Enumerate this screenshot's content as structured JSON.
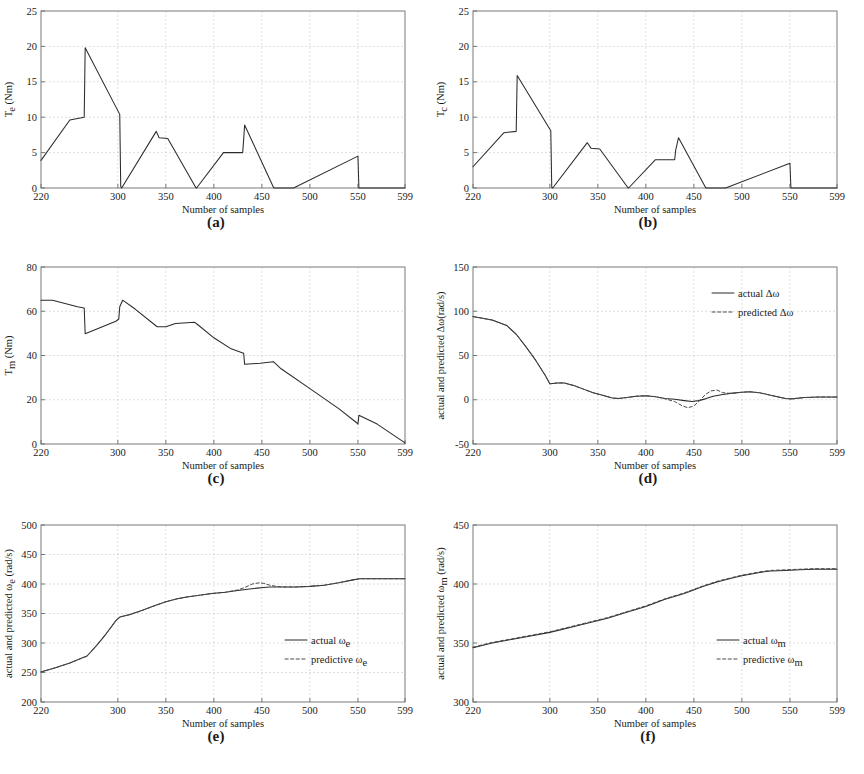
{
  "figure": {
    "panel_count": 6,
    "shared_xlabel": "Number of samples",
    "x_ticks": [
      220,
      300,
      350,
      400,
      450,
      500,
      550,
      599
    ],
    "xlim": [
      220,
      599
    ],
    "grid": true
  },
  "panels": [
    {
      "caption": "(a)",
      "chart_data": {
        "type": "line",
        "title": "",
        "xlabel": "Number of samples",
        "ylabel": "T_e (Nm)",
        "ylabel_main": "T",
        "ylabel_sub": "e",
        "ylabel_unit": " (Nm)",
        "xlim": [
          220,
          599
        ],
        "ylim": [
          0,
          25
        ],
        "x_ticks": [
          220,
          300,
          350,
          400,
          450,
          500,
          550,
          599
        ],
        "y_ticks": [
          0,
          5,
          10,
          15,
          20,
          25
        ],
        "grid": true,
        "legend": null,
        "series": [
          {
            "name": "T_e",
            "style": "solid",
            "x": [
              220,
              250,
              265,
              266,
              302,
              303,
              304,
              340,
              343,
              352,
              381,
              382,
              410,
              430,
              431,
              432,
              462,
              463,
              483,
              550,
              551,
              599
            ],
            "y": [
              3.9,
              9.6,
              10.0,
              19.8,
              10.4,
              0.2,
              0.0,
              8.0,
              7.1,
              7.0,
              0.1,
              0.0,
              5.0,
              5.0,
              6.8,
              8.9,
              0.1,
              0.0,
              0.0,
              4.5,
              0.0,
              0.0
            ]
          }
        ]
      }
    },
    {
      "caption": "(b)",
      "chart_data": {
        "type": "line",
        "title": "",
        "xlabel": "Number of samples",
        "ylabel": "T_c (Nm)",
        "ylabel_main": "T",
        "ylabel_sub": "c",
        "ylabel_unit": " (Nm)",
        "xlim": [
          220,
          599
        ],
        "ylim": [
          0,
          25
        ],
        "x_ticks": [
          220,
          300,
          350,
          400,
          450,
          500,
          550,
          599
        ],
        "y_ticks": [
          0,
          5,
          10,
          15,
          20,
          25
        ],
        "grid": true,
        "legend": null,
        "series": [
          {
            "name": "T_c",
            "style": "solid",
            "x": [
              220,
              252,
              265,
              266,
              301,
              302,
              303,
              339,
              343,
              352,
              381,
              382,
              410,
              430,
              431,
              434,
              462,
              463,
              483,
              550,
              551,
              599
            ],
            "y": [
              3.0,
              7.8,
              8.0,
              15.9,
              8.1,
              0.1,
              0.0,
              6.4,
              5.6,
              5.5,
              0.1,
              0.0,
              4.0,
              4.0,
              5.3,
              7.1,
              0.1,
              0.0,
              0.0,
              3.5,
              0.0,
              0.0
            ]
          }
        ]
      }
    },
    {
      "caption": "(c)",
      "chart_data": {
        "type": "line",
        "title": "",
        "xlabel": "Number of samples",
        "ylabel": "T_m (Nm)",
        "ylabel_main": "T",
        "ylabel_sub": "m",
        "ylabel_unit": " (Nm)",
        "xlim": [
          220,
          599
        ],
        "ylim": [
          0,
          80
        ],
        "x_ticks": [
          220,
          300,
          350,
          400,
          450,
          500,
          550,
          599
        ],
        "y_ticks": [
          0,
          20,
          40,
          60,
          80
        ],
        "grid": true,
        "legend": null,
        "series": [
          {
            "name": "T_m",
            "style": "solid",
            "x": [
              220,
              232,
              258,
              265,
              266,
              298,
              301,
              302,
              305,
              318,
              338,
              341,
              350,
              360,
              380,
              383,
              400,
              418,
              428,
              431,
              432,
              448,
              462,
              470,
              500,
              530,
              549,
              550,
              551,
              570,
              599
            ],
            "y": [
              65.0,
              65.0,
              62.0,
              61.5,
              49.8,
              55.5,
              56.5,
              62.0,
              65.0,
              61.0,
              54.0,
              53.0,
              53.0,
              54.5,
              55.0,
              54.0,
              48.0,
              43.0,
              41.5,
              41.0,
              36.0,
              36.5,
              37.2,
              34.0,
              25.0,
              16.0,
              9.5,
              9.0,
              13.0,
              9.0,
              0.5
            ]
          }
        ]
      }
    },
    {
      "caption": "(d)",
      "chart_data": {
        "type": "line",
        "title": "",
        "xlabel": "Number of samples",
        "ylabel": "actual and predicted Δω(rad/s)",
        "ylabel_main": "actual and predicted Δω(rad/s)",
        "ylabel_sub": "",
        "ylabel_unit": "",
        "xlim": [
          220,
          599
        ],
        "ylim": [
          -50,
          150
        ],
        "x_ticks": [
          220,
          300,
          350,
          400,
          450,
          500,
          550,
          599
        ],
        "y_ticks": [
          -50,
          0,
          50,
          100,
          150
        ],
        "grid": true,
        "legend": {
          "position": "top-right",
          "entries": [
            {
              "label": "actual Δω",
              "style": "solid"
            },
            {
              "label": "predicted Δω",
              "style": "dashed"
            }
          ]
        },
        "series": [
          {
            "name": "actual Δω",
            "style": "solid",
            "x": [
              220,
              240,
              255,
              265,
              275,
              285,
              295,
              300,
              308,
              315,
              325,
              335,
              345,
              355,
              365,
              372,
              380,
              390,
              400,
              410,
              420,
              430,
              440,
              448,
              455,
              462,
              470,
              480,
              490,
              500,
              508,
              518,
              530,
              545,
              552,
              565,
              580,
              599
            ],
            "y": [
              94,
              90,
              84,
              74,
              60,
              45,
              28,
              18,
              19,
              19,
              16,
              12,
              8,
              5,
              2,
              1.5,
              2.5,
              4,
              4.5,
              3.5,
              1.5,
              0.5,
              -1,
              -2,
              -1,
              1,
              4,
              6,
              7.5,
              8.5,
              9,
              8,
              5,
              1.5,
              1,
              2.5,
              3,
              3
            ]
          },
          {
            "name": "predicted Δω",
            "style": "dashed",
            "x": [
              220,
              240,
              255,
              265,
              275,
              285,
              295,
              300,
              308,
              315,
              325,
              335,
              345,
              355,
              365,
              372,
              380,
              390,
              400,
              410,
              420,
              430,
              438,
              444,
              450,
              456,
              462,
              468,
              474,
              480,
              490,
              500,
              508,
              518,
              530,
              545,
              552,
              565,
              580,
              599
            ],
            "y": [
              94,
              90,
              84,
              74,
              60,
              45,
              28,
              18,
              19,
              19,
              16,
              12,
              8,
              5,
              2,
              1.5,
              2.5,
              4,
              4.5,
              3.5,
              1,
              -2,
              -7,
              -9,
              -7,
              -1,
              6,
              10,
              11,
              8,
              7,
              8.5,
              9,
              8,
              5,
              1.5,
              1,
              2.5,
              3,
              3
            ]
          }
        ]
      }
    },
    {
      "caption": "(e)",
      "chart_data": {
        "type": "line",
        "title": "",
        "xlabel": "Number of samples",
        "ylabel": "actual and predicted ω_e (rad/s)",
        "ylabel_main": "actual and predicted ω",
        "ylabel_sub": "e",
        "ylabel_unit": " (rad/s)",
        "xlim": [
          220,
          599
        ],
        "ylim": [
          200,
          500
        ],
        "x_ticks": [
          220,
          300,
          350,
          400,
          450,
          500,
          550,
          599
        ],
        "y_ticks": [
          200,
          250,
          300,
          350,
          400,
          450,
          500
        ],
        "grid": true,
        "legend": {
          "position": "mid-right",
          "entries": [
            {
              "label": "actual ω",
              "sub": "e",
              "style": "solid"
            },
            {
              "label": "predictive ω",
              "sub": "e",
              "style": "dashed"
            }
          ]
        },
        "series": [
          {
            "name": "actual ω_e",
            "style": "solid",
            "x": [
              220,
              235,
              250,
              262,
              268,
              278,
              288,
              298,
              302,
              312,
              325,
              338,
              350,
              362,
              372,
              385,
              398,
              412,
              425,
              435,
              445,
              452,
              458,
              465,
              472,
              485,
              500,
              515,
              530,
              545,
              552,
              565,
              580,
              599
            ],
            "y": [
              251,
              258,
              266,
              274,
              278,
              296,
              316,
              338,
              344,
              348,
              355,
              363,
              370,
              375,
              378,
              381,
              384,
              386,
              389,
              391,
              393,
              394,
              395,
              395,
              395,
              395,
              396,
              398,
              402,
              407,
              409,
              409,
              409,
              409
            ]
          },
          {
            "name": "predictive ω_e",
            "style": "dashed",
            "x": [
              220,
              235,
              250,
              262,
              268,
              278,
              288,
              298,
              302,
              312,
              325,
              338,
              350,
              362,
              372,
              385,
              398,
              412,
              425,
              432,
              440,
              447,
              452,
              458,
              465,
              472,
              485,
              500,
              515,
              530,
              545,
              552,
              565,
              580,
              599
            ],
            "y": [
              251,
              258,
              266,
              274,
              278,
              296,
              316,
              338,
              344,
              348,
              355,
              363,
              370,
              375,
              378,
              381,
              384,
              386,
              390,
              394,
              400,
              402,
              401,
              398,
              396,
              395,
              395,
              396,
              398,
              402,
              407,
              409,
              409,
              409,
              409
            ]
          }
        ]
      }
    },
    {
      "caption": "(f)",
      "chart_data": {
        "type": "line",
        "title": "",
        "xlabel": "Number of samples",
        "ylabel": "actual and predicted ω_m (rad/s)",
        "ylabel_main": "actual and predicted ω",
        "ylabel_sub": "m",
        "ylabel_unit": " (rad/s)",
        "xlim": [
          220,
          599
        ],
        "ylim": [
          300,
          450
        ],
        "x_ticks": [
          220,
          300,
          350,
          400,
          450,
          500,
          550,
          599
        ],
        "y_ticks": [
          300,
          350,
          400,
          450
        ],
        "grid": true,
        "legend": {
          "position": "mid-right",
          "entries": [
            {
              "label": "actual ω",
              "sub": "m",
              "style": "solid"
            },
            {
              "label": "predictive ω",
              "sub": "m",
              "style": "dashed"
            }
          ]
        },
        "series": [
          {
            "name": "actual ω_m",
            "style": "solid",
            "x": [
              220,
              240,
              260,
              280,
              300,
              320,
              340,
              360,
              380,
              400,
              420,
              440,
              460,
              475,
              490,
              500,
              510,
              520,
              530,
              545,
              560,
              575,
              599
            ],
            "y": [
              346,
              350,
              353,
              356,
              359,
              363,
              367,
              371,
              376,
              381,
              387,
              392,
              398,
              402,
              405,
              407,
              408.5,
              410,
              411,
              411.5,
              412,
              412.5,
              412.5
            ]
          },
          {
            "name": "predictive ω_m",
            "style": "dashed",
            "x": [
              220,
              240,
              260,
              280,
              300,
              320,
              340,
              360,
              380,
              400,
              420,
              440,
              460,
              475,
              490,
              500,
              510,
              520,
              530,
              545,
              560,
              575,
              599
            ],
            "y": [
              346.5,
              350.5,
              353.5,
              356.5,
              359.5,
              363.5,
              367.5,
              371.5,
              376.5,
              381.5,
              387.5,
              392.5,
              398.5,
              402.5,
              405.5,
              407.5,
              409,
              410.5,
              411.5,
              412,
              412.5,
              413,
              413
            ]
          }
        ]
      }
    }
  ]
}
